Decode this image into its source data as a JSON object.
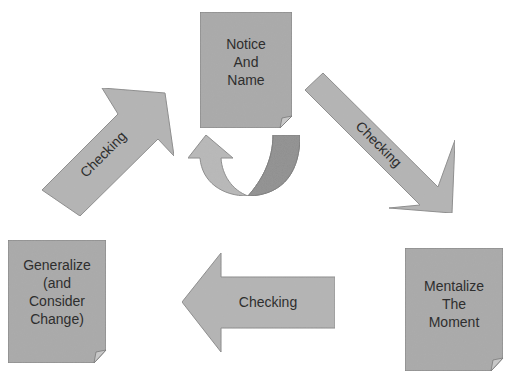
{
  "diagram": {
    "type": "cycle",
    "colors": {
      "box_fill": "#a9a9a9",
      "box_stroke": "#7a7a7a",
      "arrow_fill": "#b4b4b4",
      "arrow_stroke": "#8a8a8a",
      "curve_dark": "#8e8e8e",
      "curve_light": "#b8b8b8",
      "text": "#2e2e2e"
    },
    "nodes": [
      {
        "id": "notice",
        "lines": [
          "Notice",
          "And",
          "Name"
        ]
      },
      {
        "id": "mentalize",
        "lines": [
          "Mentalize",
          "The",
          "Moment"
        ]
      },
      {
        "id": "generalize",
        "lines": [
          "Generalize",
          "(and",
          "Consider",
          "Change)"
        ]
      }
    ],
    "arrows": [
      {
        "from": "notice",
        "to": "mentalize",
        "label": "Checking"
      },
      {
        "from": "mentalize",
        "to": "generalize",
        "label": "Checking"
      },
      {
        "from": "generalize",
        "to": "notice",
        "label": "Checking"
      }
    ],
    "self_loop": {
      "node": "notice",
      "icon": "curved-return-arrow"
    }
  }
}
